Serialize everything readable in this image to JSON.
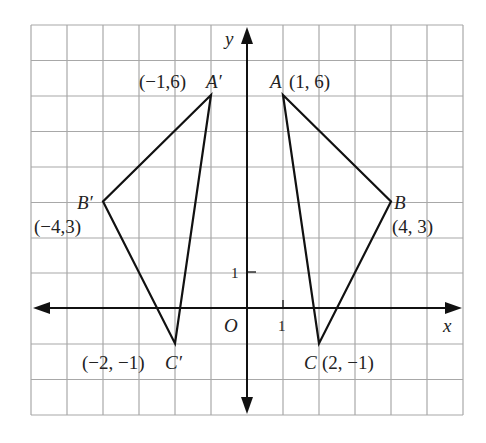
{
  "axes": {
    "x_label": "x",
    "y_label": "y",
    "origin_label": "O",
    "x_tick": "1",
    "y_tick": "1"
  },
  "points": {
    "A": {
      "name": "A",
      "coords": "(1, 6)",
      "x": 1,
      "y": 6
    },
    "B": {
      "name": "B",
      "coords": "(4, 3)",
      "x": 4,
      "y": 3
    },
    "C": {
      "name": "C",
      "coords": "(2, −1)",
      "x": 2,
      "y": -1
    },
    "A_prime": {
      "name": "A′",
      "coords": "(−1,6)",
      "x": -1,
      "y": 6
    },
    "B_prime": {
      "name": "B′",
      "coords": "(−4,3)",
      "x": -4,
      "y": 3
    },
    "C_prime": {
      "name": "C′",
      "coords": "(−2, −1)",
      "x": -2,
      "y": -1
    }
  },
  "colors": {
    "grid": "#a8a8a8",
    "lines": "#111111"
  }
}
